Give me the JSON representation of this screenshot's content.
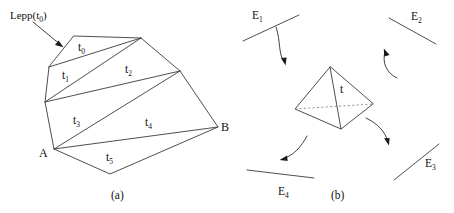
{
  "figure": {
    "caption_a": "(a)",
    "caption_b": "(b)",
    "panel_a": {
      "lepp_label_prefix": "Lepp(t",
      "lepp_label_sub": "0",
      "lepp_label_suffix": ")",
      "triangle_labels": [
        {
          "name": "t",
          "sub": "0"
        },
        {
          "name": "t",
          "sub": "1"
        },
        {
          "name": "t",
          "sub": "2"
        },
        {
          "name": "t",
          "sub": "3"
        },
        {
          "name": "t",
          "sub": "4"
        },
        {
          "name": "t",
          "sub": "5"
        }
      ],
      "vertex_a": "A",
      "vertex_b": "B"
    },
    "panel_b": {
      "tetra_label": "t",
      "edge_labels": [
        {
          "name": "E",
          "sub": "1"
        },
        {
          "name": "E",
          "sub": "2"
        },
        {
          "name": "E",
          "sub": "3"
        },
        {
          "name": "E",
          "sub": "4"
        }
      ]
    }
  },
  "style": {
    "line_color": "#3a3a3a",
    "dashed_color": "#7c7c7c",
    "text_color": "#111111",
    "background": "#ffffff"
  }
}
